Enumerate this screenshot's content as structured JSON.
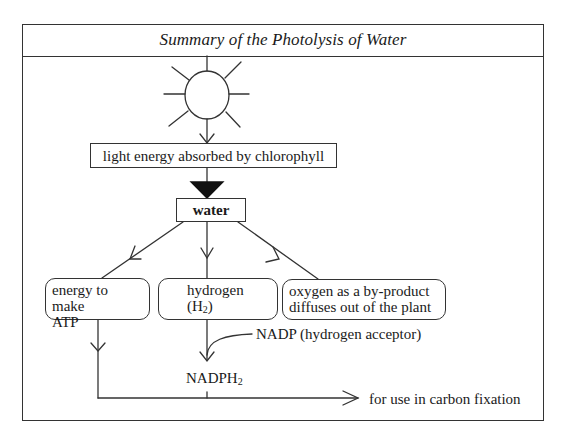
{
  "diagram": {
    "title": "Summary of the Photolysis of Water",
    "nodes": {
      "sun": {
        "icon": "sun-icon",
        "label": ""
      },
      "light_energy": {
        "label": "light energy absorbed by chlorophyll"
      },
      "water": {
        "label": "water"
      },
      "energy_atp": {
        "line1": "energy to make",
        "line2": "ATP"
      },
      "hydrogen": {
        "line1": "hydrogen",
        "line2_prefix": "(H",
        "line2_sub": "2",
        "line2_suffix": ")"
      },
      "oxygen": {
        "line1": "oxygen as a by-product",
        "line2": "diffuses out of the plant"
      },
      "nadp": {
        "label": "NADP (hydrogen acceptor)"
      },
      "nadph2": {
        "prefix": "NADPH",
        "sub": "2"
      },
      "carbon_fixation": {
        "label": "for use in carbon fixation"
      }
    },
    "edges": [
      {
        "from": "sun",
        "to": "light_energy",
        "arrow": "open"
      },
      {
        "from": "light_energy",
        "to": "water",
        "arrow": "filled-triangle"
      },
      {
        "from": "water",
        "to": "energy_atp",
        "arrow": "open"
      },
      {
        "from": "water",
        "to": "hydrogen",
        "arrow": "open"
      },
      {
        "from": "water",
        "to": "oxygen",
        "arrow": "open"
      },
      {
        "from": "hydrogen",
        "to": "nadph2",
        "arrow": "open"
      },
      {
        "from": "nadp",
        "to": "nadph2",
        "arrow": "curved-join"
      },
      {
        "from": "energy_atp",
        "to": "carbon_fixation",
        "arrow": "open"
      },
      {
        "from": "nadph2",
        "to": "carbon_fixation",
        "arrow": "open"
      }
    ],
    "colors": {
      "line": "#333333",
      "fill": "#ffffff",
      "arrow_fill": "#111111"
    }
  }
}
